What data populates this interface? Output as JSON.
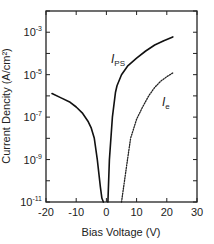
{
  "chart_data": {
    "type": "line",
    "title": "",
    "xlabel": "Bias Voltage (V)",
    "ylabel": "Current Dencity (A/cm²)",
    "xlim": [
      -20,
      30
    ],
    "ylim": [
      1e-11,
      0.01
    ],
    "yscale": "log",
    "grid": false,
    "legend": "inline labels",
    "x_ticks": [
      -20,
      -10,
      0,
      10,
      20,
      30
    ],
    "x_tick_labels": [
      "-20",
      "-10",
      "0",
      "10",
      "20",
      "30"
    ],
    "y_ticks_major": [
      -11,
      -9,
      -7,
      -5,
      -3
    ],
    "y_tick_labels": [
      {
        "base": "10",
        "exp": "-11"
      },
      {
        "base": "10",
        "exp": "-9"
      },
      {
        "base": "10",
        "exp": "-7"
      },
      {
        "base": "10",
        "exp": "-5"
      },
      {
        "base": "10",
        "exp": "-3"
      }
    ],
    "series": [
      {
        "name": "I_PS",
        "label_main": "I",
        "label_sub": "PS",
        "style": "solid",
        "color": "#111111",
        "branches": [
          {
            "x": [
              -18,
              -15,
              -12,
              -10,
              -8,
              -6,
              -5,
              -4,
              -3,
              -2,
              -1.5,
              -1
            ],
            "y": [
              1.3e-06,
              8e-07,
              5e-07,
              3e-07,
              1.6e-07,
              6e-08,
              3e-08,
              1e-08,
              1e-09,
              5e-11,
              1.5e-11,
              1e-11
            ]
          },
          {
            "x": [
              0.5,
              1,
              2,
              3,
              3.5,
              5,
              7,
              10,
              13,
              16,
              19,
              22
            ],
            "y": [
              1e-11,
              1e-09,
              1e-07,
              1.5e-06,
              3e-06,
              1e-05,
              2.5e-05,
              6e-05,
              0.00013,
              0.00025,
              0.0004,
              0.0006
            ]
          }
        ]
      },
      {
        "name": "I_e",
        "label_main": "I",
        "label_sub": "e",
        "style": "dotted",
        "color": "#222222",
        "branches": [
          {
            "x": [
              5,
              6,
              7,
              8,
              10,
              12,
              14,
              16,
              18,
              20,
              22
            ],
            "y": [
              1e-11,
              1e-10,
              1e-09,
              1e-08,
              8e-08,
              3e-07,
              1e-06,
              2.5e-06,
              5e-06,
              8e-06,
              1.2e-05
            ]
          }
        ]
      }
    ]
  }
}
